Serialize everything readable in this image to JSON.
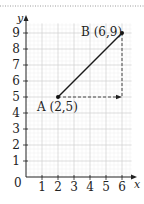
{
  "figure": {
    "axes": {
      "x_label": "x",
      "y_label": "y",
      "origin_label": "0",
      "x_ticks": [
        "1",
        "2",
        "3",
        "4",
        "5",
        "6"
      ],
      "y_ticks": [
        "1",
        "2",
        "3",
        "4",
        "5",
        "6",
        "7",
        "8",
        "9"
      ]
    },
    "points": [
      {
        "name": "A",
        "label": "A (2,5)",
        "x": 2,
        "y": 5
      },
      {
        "name": "B",
        "label": "B (6,9)",
        "x": 6,
        "y": 9
      }
    ],
    "segment": {
      "from": "A",
      "to": "B"
    },
    "dashed_path": {
      "horizontal": "A to (6,5)",
      "vertical": "B to (6,5)"
    },
    "colors": {
      "line": "#1a1a1a",
      "grid_major": "#c8c8c8",
      "grid_minor": "#e6e6e6",
      "dashed": "#333333"
    }
  },
  "chart_data": {
    "type": "line",
    "title": "",
    "xlabel": "x",
    "ylabel": "y",
    "xlim": [
      0,
      6
    ],
    "ylim": [
      0,
      9
    ],
    "grid": true,
    "series": [
      {
        "name": "AB",
        "x": [
          2,
          6
        ],
        "y": [
          5,
          9
        ]
      }
    ],
    "annotations": [
      {
        "text": "A (2,5)",
        "x": 2,
        "y": 5
      },
      {
        "text": "B (6,9)",
        "x": 6,
        "y": 9
      }
    ],
    "guides": [
      {
        "type": "dashed-arrow",
        "from": [
          2,
          5
        ],
        "to": [
          6,
          5
        ]
      },
      {
        "type": "dashed",
        "from": [
          6,
          9
        ],
        "to": [
          6,
          5
        ]
      }
    ]
  }
}
